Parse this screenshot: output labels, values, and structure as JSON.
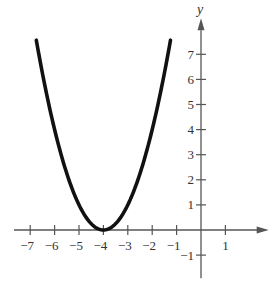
{
  "chart_data": {
    "type": "line",
    "title": "",
    "function": "y = (x + 4)^2",
    "xlabel": "x",
    "ylabel": "y",
    "xlim": [
      -7.5,
      2.2
    ],
    "ylim": [
      -1.6,
      8.2
    ],
    "x_ticks": [
      -7,
      -6,
      -5,
      -4,
      -3,
      -2,
      -1,
      1
    ],
    "x_tick_labels": [
      "−7",
      "−6",
      "−5",
      "−4",
      "−3",
      "−2",
      "−1",
      "1"
    ],
    "y_ticks": [
      -1,
      1,
      2,
      3,
      4,
      5,
      6,
      7
    ],
    "y_tick_labels": [
      "−1",
      "1",
      "2",
      "3",
      "4",
      "5",
      "6",
      "7"
    ],
    "grid": false,
    "legend": null,
    "series": [
      {
        "name": "parabola",
        "color": "#111111",
        "x": [
          -6.75,
          -6.5,
          -6,
          -5.5,
          -5,
          -4.5,
          -4,
          -3.5,
          -3,
          -2.5,
          -2,
          -1.5,
          -1.25
        ],
        "values": [
          7.56,
          6.25,
          4,
          2.25,
          1,
          0.25,
          0,
          0.25,
          1,
          2.25,
          4,
          6.25,
          7.56
        ]
      }
    ],
    "vertex": [
      -4,
      0
    ]
  },
  "layout": {
    "origin_px": [
      201,
      230
    ],
    "x_unit_px": 24.4,
    "y_unit_px": 25.1,
    "axis_color": "#555555",
    "curve_color": "#111111"
  }
}
